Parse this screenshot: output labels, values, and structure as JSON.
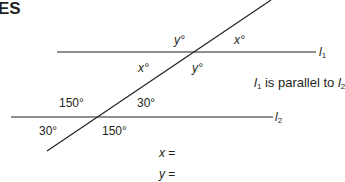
{
  "heading": "ES",
  "lines": {
    "l1": {
      "label": "l",
      "sub": "1"
    },
    "l2": {
      "label": "l",
      "sub": "2"
    },
    "color": "#231f20"
  },
  "angles": {
    "upper": {
      "top_left": "y°",
      "top_right": "x°",
      "bottom_left": "x°",
      "bottom_right": "y°"
    },
    "lower": {
      "top_left": "150°",
      "top_right": "30°",
      "bottom_left": "30°",
      "bottom_right": "150°"
    }
  },
  "note": {
    "l1": "l",
    "l1_sub": "1",
    "text": " is parallel to ",
    "l2": "l",
    "l2_sub": "2"
  },
  "answers": {
    "x_label": "x",
    "y_label": "y",
    "equals": " ="
  }
}
